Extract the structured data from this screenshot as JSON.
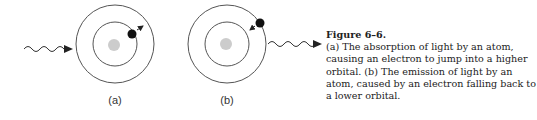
{
  "figure": {
    "panels": [
      {
        "id": "a",
        "label": "(a)",
        "process": "absorption",
        "electron_orbit": "outer",
        "arrow_direction": "outward"
      },
      {
        "id": "b",
        "label": "(b)",
        "process": "emission",
        "electron_orbit": "outer",
        "arrow_direction": "inward"
      }
    ],
    "colors": {
      "orbit": "#555555",
      "nucleus": "#cccccc",
      "electron": "#111111",
      "wave": "#333333"
    }
  },
  "caption": {
    "title": "Figure 6–6.",
    "text": "(a) The absorption of light by an atom, causing an electron to jump into a higher orbital. (b) The emission of light by an atom, caused by an electron falling back to a lower orbital."
  }
}
